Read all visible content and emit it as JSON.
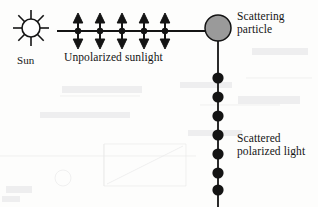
{
  "diagram": {
    "type": "physics-optics-diagram",
    "background_color": "#fdfdfc",
    "stroke_color": "#141414"
  },
  "sun": {
    "label": "Sun",
    "icon": "sun-icon",
    "ray_count": 8,
    "center": {
      "x": 31,
      "y": 28
    },
    "radius": 9,
    "fill_color": "#ffffff",
    "stroke_color": "#141414"
  },
  "incident_beam": {
    "label": "Unpolarized sunlight",
    "start_x": 57,
    "end_x": 205,
    "y": 31,
    "stroke_color": "#141414",
    "polarization_markers": {
      "type": "double-headed-vertical-arrow",
      "count": 5,
      "x_positions": [
        78,
        100,
        122,
        144,
        165
      ],
      "top_y": 14,
      "bottom_y": 48,
      "center_dot_radius": 3,
      "color": "#141414"
    }
  },
  "scattering_particle": {
    "label_line_1": "Scattering",
    "label_line_2": "particle",
    "center": {
      "x": 218,
      "y": 28
    },
    "radius": 13,
    "fill_color": "#9a9a9a",
    "stroke_color": "#141414"
  },
  "scattered_beam": {
    "label_line_1": "Scattered",
    "label_line_2": "polarized light",
    "x": 218,
    "start_y": 41,
    "end_y": 207,
    "stroke_color": "#141414",
    "polarization_markers": {
      "type": "filled-dot",
      "count": 7,
      "y_positions": [
        78,
        97,
        116,
        135,
        154,
        173,
        190
      ],
      "radius": 5.5,
      "color": "#141414"
    }
  }
}
